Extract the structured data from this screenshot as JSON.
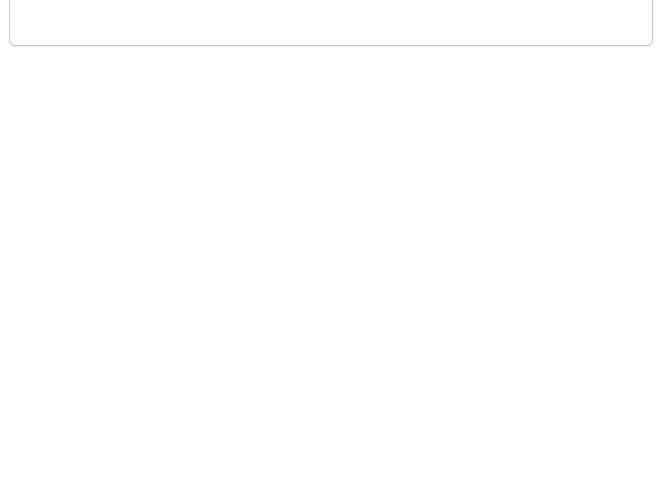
{
  "colors": {
    "line": "#9a9a9a",
    "arc": "#7d7d7d",
    "arrow": "#333333",
    "text": "#222222",
    "answer_box": "#ececec",
    "panel_border": "#c9c9c9"
  },
  "angle_label": "60°",
  "top_panel": {
    "examples": [
      {
        "id": "example-1",
        "base": [
          [
            44,
            19
          ],
          [
            157,
            19
          ]
        ],
        "apex_clip": [
          [
            56,
            -5
          ],
          [
            145,
            -5
          ]
        ],
        "labels": [
          {
            "text": "60°",
            "x": 54,
            "y": 15
          }
        ],
        "arcs": [
          {
            "cx": 44,
            "cy": 19,
            "a0": -60,
            "a1": 0,
            "r": 11
          },
          {
            "cx": 157,
            "cy": 19,
            "a0": 180,
            "a1": 240,
            "r": 11
          }
        ],
        "ticks": [],
        "arrow": null
      },
      {
        "id": "example-2",
        "base": [
          [
            260,
            19
          ],
          [
            362,
            19
          ]
        ],
        "apex_clip": [
          [
            272,
            -5
          ],
          [
            350,
            -5
          ]
        ],
        "labels": [
          {
            "text": "60°",
            "x": 272,
            "y": 15
          }
        ],
        "arcs": [
          {
            "cx": 260,
            "cy": 19,
            "a0": -60,
            "a1": 0,
            "r": 11
          },
          {
            "cx": 362,
            "cy": 19,
            "a0": 180,
            "a1": 240,
            "r": 11
          }
        ],
        "ticks": [
          {
            "x": 311,
            "y": 19,
            "vertical": true
          }
        ],
        "arrow": null
      },
      {
        "id": "example-3",
        "base": [
          [
            470,
            19
          ],
          [
            573,
            19
          ]
        ],
        "apex_clip": [
          [
            482,
            -5
          ],
          [
            561,
            -5
          ]
        ],
        "labels": [
          {
            "text": "60°",
            "x": 484,
            "y": 15
          }
        ],
        "arcs": [
          {
            "cx": 470,
            "cy": 19,
            "a0": -60,
            "a1": 0,
            "r": 11
          },
          {
            "cx": 573,
            "cy": 19,
            "a0": 180,
            "a1": 240,
            "r": 11
          }
        ],
        "ticks": [
          {
            "x": 521,
            "y": 19,
            "vertical": true
          }
        ],
        "arrow": {
          "d": "M 552 -2 Q 555 4 558 9",
          "tip": [
            558,
            9
          ]
        }
      }
    ]
  },
  "triangles": [
    {
      "id": "triangle-1",
      "vertices": [
        [
          86,
          89
        ],
        [
          21,
          197
        ],
        [
          151,
          197
        ]
      ],
      "arcs": [
        0,
        1,
        2
      ],
      "labels": [
        {
          "text": "60°",
          "x": 73,
          "y": 126
        },
        {
          "text": "60°",
          "x": 40,
          "y": 190
        }
      ],
      "ticks": [
        [
          53,
          143
        ],
        [
          119,
          143
        ],
        [
          86,
          197
        ]
      ],
      "answer_boxes": [
        {
          "x": 146,
          "y": 144,
          "w": 49,
          "h": 33
        }
      ],
      "arrows": [
        {
          "d": "M 147 161 Q 131 166 130 183",
          "tip": [
            130,
            185
          ]
        }
      ]
    },
    {
      "id": "triangle-2",
      "vertices": [
        [
          242,
          109
        ],
        [
          407,
          76
        ],
        [
          355,
          230
        ]
      ],
      "arcs": [
        0,
        1,
        2
      ],
      "labels": [
        {
          "text": "60°",
          "x": 265,
          "y": 123
        },
        {
          "text": "60°",
          "x": 363,
          "y": 108
        }
      ],
      "ticks": [],
      "answer_boxes": [
        {
          "x": 382,
          "y": 174,
          "w": 49,
          "h": 33
        }
      ],
      "arrows": [
        {
          "d": "M 382 189 Q 362 184 352 203",
          "tip": [
            350,
            206
          ]
        }
      ]
    },
    {
      "id": "triangle-3",
      "vertices": [
        [
          512,
          94
        ],
        [
          618,
          151
        ],
        [
          512,
          210
        ]
      ],
      "arcs": [
        0,
        1,
        2
      ],
      "labels": [
        {
          "text": "60°",
          "x": 515,
          "y": 124
        }
      ],
      "ticks": [],
      "answer_boxes": [
        {
          "x": 580,
          "y": 92,
          "w": 48,
          "h": 32
        },
        {
          "x": 540,
          "y": 205,
          "w": 48,
          "h": 33
        }
      ],
      "arrows": [
        {
          "d": "M 586 128 Q 584 141 593 150",
          "tip": [
            595,
            152
          ]
        },
        {
          "d": "M 555 205 Q 546 188 524 193",
          "tip": [
            521,
            194
          ]
        }
      ]
    },
    {
      "id": "triangle-4",
      "vertices": [
        [
          11,
          349
        ],
        [
          163,
          349
        ],
        [
          87,
          473
        ]
      ],
      "arcs": [
        0,
        1,
        2
      ],
      "labels": [
        {
          "text": "60°",
          "x": 74,
          "y": 448
        }
      ],
      "ticks": [],
      "answer_boxes": [
        {
          "x": 27,
          "y": 306,
          "w": 49,
          "h": 33
        },
        {
          "x": 155,
          "y": 375,
          "w": 49,
          "h": 33
        }
      ],
      "arrows": [
        {
          "d": "M 51 339 Q 51 356 34 359",
          "tip": [
            31,
            359
          ]
        },
        {
          "d": "M 155 390 Q 141 382 143 364",
          "tip": [
            143,
            361
          ]
        }
      ]
    },
    {
      "id": "triangle-5",
      "vertices": [
        [
          249,
          375
        ],
        [
          358,
          340
        ],
        [
          335,
          449
        ]
      ],
      "arcs": [
        0,
        1,
        2
      ],
      "labels": [],
      "ticks": [],
      "answer_boxes": [
        {
          "x": 253,
          "y": 321,
          "w": 49,
          "h": 33
        },
        {
          "x": 368,
          "y": 367,
          "w": 49,
          "h": 33
        },
        {
          "x": 260,
          "y": 434,
          "w": 49,
          "h": 33
        }
      ],
      "arrows": [
        {
          "d": "M 288 354 Q 290 372 272 377",
          "tip": [
            269,
            378
          ]
        },
        {
          "d": "M 367 383 Q 348 378 345 359",
          "tip": [
            344,
            356
          ]
        },
        {
          "d": "M 293 435 Q 300 420 326 431",
          "tip": [
            329,
            433
          ]
        }
      ]
    },
    {
      "id": "triangle-6",
      "vertices": [
        [
          478,
          318
        ],
        [
          650,
          378
        ],
        [
          510,
          490
        ]
      ],
      "arcs": [
        0,
        1,
        2
      ],
      "labels": [],
      "ticks": [],
      "answer_boxes": [
        {
          "x": 506,
          "y": 292,
          "w": 48,
          "h": 32
        },
        {
          "x": 610,
          "y": 414,
          "w": 48,
          "h": 33
        },
        {
          "x": 444,
          "y": 438,
          "w": 48,
          "h": 33
        }
      ],
      "arrows": [
        {
          "d": "M 529 324 Q 523 342 501 340",
          "tip": [
            498,
            340
          ]
        },
        {
          "d": "M 619 414 Q 613 401 624 386",
          "tip": [
            626,
            383
          ]
        },
        {
          "d": "M 492 453 Q 514 454 518 470",
          "tip": [
            519,
            473
          ]
        }
      ]
    }
  ]
}
